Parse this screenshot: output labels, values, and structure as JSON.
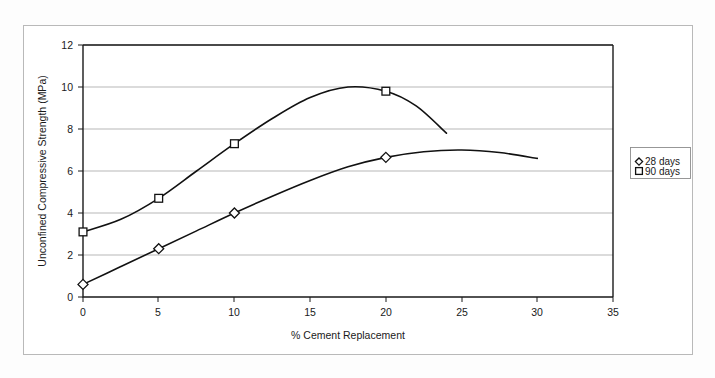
{
  "chart_data": {
    "type": "line",
    "title": "",
    "xlabel": "% Cement Replacement",
    "ylabel": "Unconfined Compressive Strength (MPa)",
    "xlim": [
      0,
      35
    ],
    "ylim": [
      0,
      12
    ],
    "xticks": [
      "0",
      "5",
      "10",
      "15",
      "20",
      "25",
      "30",
      "35"
    ],
    "yticks": [
      "0",
      "2",
      "4",
      "6",
      "8",
      "10",
      "12"
    ],
    "grid": "horizontal",
    "legend_position": "right-outside",
    "series": [
      {
        "name": "28 days",
        "marker": "diamond",
        "x": [
          0,
          5,
          10,
          20
        ],
        "values": [
          0.6,
          2.3,
          4.0,
          6.65
        ],
        "curve_x": [
          0,
          2.5,
          5,
          7.5,
          10,
          12.5,
          15,
          17.5,
          20,
          22.5,
          25,
          27.5,
          30
        ],
        "curve_y": [
          0.6,
          1.45,
          2.3,
          3.15,
          4.0,
          4.8,
          5.55,
          6.2,
          6.65,
          6.92,
          7.0,
          6.88,
          6.6
        ]
      },
      {
        "name": "90 days",
        "marker": "square",
        "x": [
          0,
          5,
          10,
          20
        ],
        "values": [
          3.1,
          4.7,
          7.3,
          9.8
        ],
        "curve_x": [
          0,
          2.5,
          5,
          7.5,
          10,
          12.5,
          15,
          17.5,
          20,
          22,
          24
        ],
        "curve_y": [
          3.1,
          3.7,
          4.7,
          6.0,
          7.3,
          8.5,
          9.5,
          10.0,
          9.8,
          9.1,
          7.8
        ]
      }
    ]
  },
  "legend": {
    "entries": [
      {
        "label": "28 days",
        "marker": "diamond"
      },
      {
        "label": "90 days",
        "marker": "square"
      }
    ]
  },
  "axes": {
    "x_title": "% Cement Replacement",
    "y_title": "Unconfined Compressive Strength (MPa)"
  }
}
